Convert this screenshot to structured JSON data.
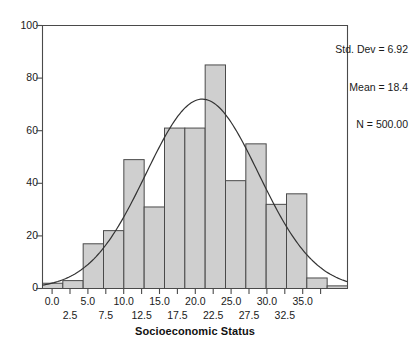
{
  "chart_data": {
    "type": "bar",
    "title": "",
    "subtitle": "",
    "xlabel": "Socioeconomic Status",
    "ylabel": "",
    "xlim": [
      -1.25,
      36.25
    ],
    "ylim": [
      0,
      100
    ],
    "grid": false,
    "bin_width": 2.5,
    "categories": [
      "0.0",
      "2.5",
      "5.0",
      "7.5",
      "10.0",
      "12.5",
      "15.0",
      "17.5",
      "20.0",
      "22.5",
      "25.0",
      "27.5",
      "30.0",
      "32.5",
      "35.0"
    ],
    "bin_centers": [
      0.0,
      2.5,
      5.0,
      7.5,
      10.0,
      12.5,
      15.0,
      17.5,
      20.0,
      22.5,
      25.0,
      27.5,
      30.0,
      32.5,
      35.0
    ],
    "values": [
      2,
      3,
      17,
      22,
      49,
      31,
      61,
      61,
      85,
      41,
      55,
      32,
      36,
      4,
      1
    ],
    "series": [
      {
        "name": "Frequency",
        "values": [
          2,
          3,
          17,
          22,
          49,
          31,
          61,
          61,
          85,
          41,
          55,
          32,
          36,
          4,
          1
        ]
      }
    ],
    "overlay_curve": {
      "name": "Normal curve",
      "mean": 18.4,
      "std_dev": 6.92,
      "n": 500,
      "peak_value": 72
    },
    "xticks": [
      0.0,
      2.5,
      5.0,
      7.5,
      10.0,
      12.5,
      15.0,
      17.5,
      20.0,
      22.5,
      25.0,
      27.5,
      30.0,
      32.5,
      35.0
    ],
    "xtick_labels_row1": [
      "0.0",
      "5.0",
      "10.0",
      "15.0",
      "20.0",
      "25.0",
      "30.0",
      "35.0"
    ],
    "xtick_labels_row2": [
      "2.5",
      "7.5",
      "12.5",
      "17.5",
      "22.5",
      "27.5",
      "32.5"
    ],
    "yticks": [
      0,
      20,
      40,
      60,
      80,
      100
    ],
    "ytick_labels": [
      "0",
      "20",
      "40",
      "60",
      "80",
      "100"
    ],
    "legend_position": "top-right"
  },
  "legend": {
    "std_dev": "Std. Dev = 6.92",
    "mean": "Mean = 18.4",
    "n": "N = 500.00"
  },
  "axis": {
    "x_title": "Socioeconomic Status"
  },
  "colors": {
    "bar_fill": "#cfcfcf",
    "bar_stroke": "#4a4a4a",
    "curve": "#333333",
    "axis": "#4a4a4a",
    "text": "#1a1a1a"
  }
}
